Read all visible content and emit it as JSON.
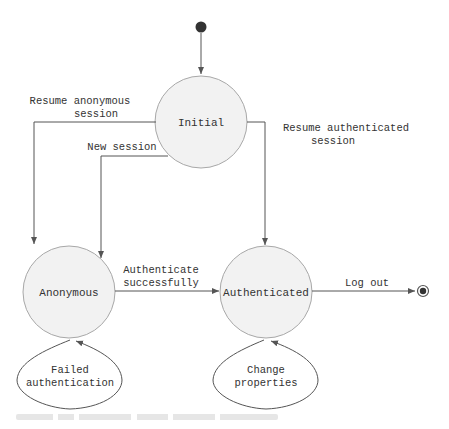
{
  "diagram": {
    "type": "state-machine",
    "colors": {
      "state_fill": "#f2f2f2",
      "state_stroke": "#a8a8a8",
      "line": "#555555",
      "text": "#333333"
    },
    "states": {
      "initial_pseudo": {
        "label": ""
      },
      "initial": {
        "label": "Initial"
      },
      "anonymous": {
        "label": "Anonymous"
      },
      "authenticated": {
        "label": "Authenticated"
      },
      "final_pseudo": {
        "label": ""
      }
    },
    "transitions": {
      "resume_anonymous": {
        "line1": "Resume anonymous",
        "line2": "session"
      },
      "new_session": {
        "line1": "New session"
      },
      "resume_authenticated": {
        "line1": "Resume authenticated",
        "line2": "session"
      },
      "authenticate": {
        "line1": "Authenticate",
        "line2": "successfully"
      },
      "log_out": {
        "line1": "Log out"
      },
      "failed_auth": {
        "line1": "Failed",
        "line2": "authentication"
      },
      "change_props": {
        "line1": "Change",
        "line2": "properties"
      }
    }
  }
}
